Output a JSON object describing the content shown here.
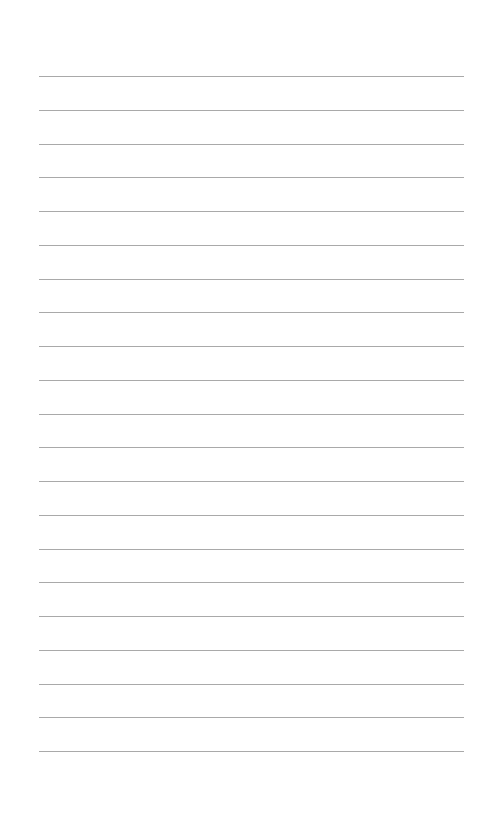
{
  "page": {
    "type": "blank lined paper",
    "line_count": 21,
    "first_line_y": 76,
    "line_spacing": 33.75,
    "line_left": 39,
    "line_width": 425,
    "line_color": "#a9a9a9",
    "background_color": "#ffffff"
  }
}
